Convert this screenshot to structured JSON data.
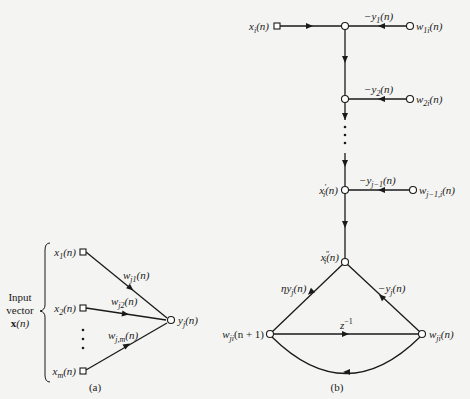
{
  "figure_a": {
    "caption": "(a)",
    "input_label": [
      "Input",
      "vector",
      "x(n)"
    ],
    "inputs": [
      {
        "label": "x",
        "sub": "1",
        "arg": "(n)"
      },
      {
        "label": "x",
        "sub": "2",
        "arg": "(n)"
      },
      {
        "label": "x",
        "sub": "m",
        "arg": "(n)"
      }
    ],
    "weights": [
      {
        "label": "w",
        "sub": "j1",
        "arg": "(n)"
      },
      {
        "label": "w",
        "sub": "j2",
        "arg": "(n)"
      },
      {
        "label": "w",
        "sub": "j,m",
        "arg": "(n)"
      }
    ],
    "output": {
      "label": "y",
      "sub": "j",
      "arg": "(n)"
    }
  },
  "figure_b": {
    "caption": "(b)",
    "input": {
      "label": "x",
      "sub": "i",
      "arg": "(n)"
    },
    "branches": [
      {
        "gain": "−y",
        "gain_sub": "1",
        "gain_arg": "(n)",
        "source": "w",
        "source_sub": "1i",
        "source_arg": "(n)"
      },
      {
        "gain": "−y",
        "gain_sub": "2",
        "gain_arg": "(n)",
        "source": "w",
        "source_sub": "2i",
        "source_arg": "(n)"
      },
      {
        "gain": "−y",
        "gain_sub": "j−1",
        "gain_arg": "(n)",
        "source": "w",
        "source_sub": "j−1,i",
        "source_arg": "(n)"
      }
    ],
    "node_xprime": {
      "label": "x",
      "sub": "i",
      "sup": "′",
      "arg": "(n)"
    },
    "node_xdprime": {
      "label": "x",
      "sub": "i",
      "sup": "″",
      "arg": "(n)"
    },
    "left_edge": {
      "label": "ηy",
      "sub": "j",
      "arg": "(n)"
    },
    "right_edge": {
      "label": "−y",
      "sub": "j",
      "arg": "(n)"
    },
    "delay": {
      "label": "z",
      "sup": "−1"
    },
    "left_node": {
      "label": "w",
      "sub": "ji",
      "arg": "(n + 1)"
    },
    "right_node": {
      "label": "w",
      "sub": "ji",
      "arg": "(n)"
    }
  }
}
